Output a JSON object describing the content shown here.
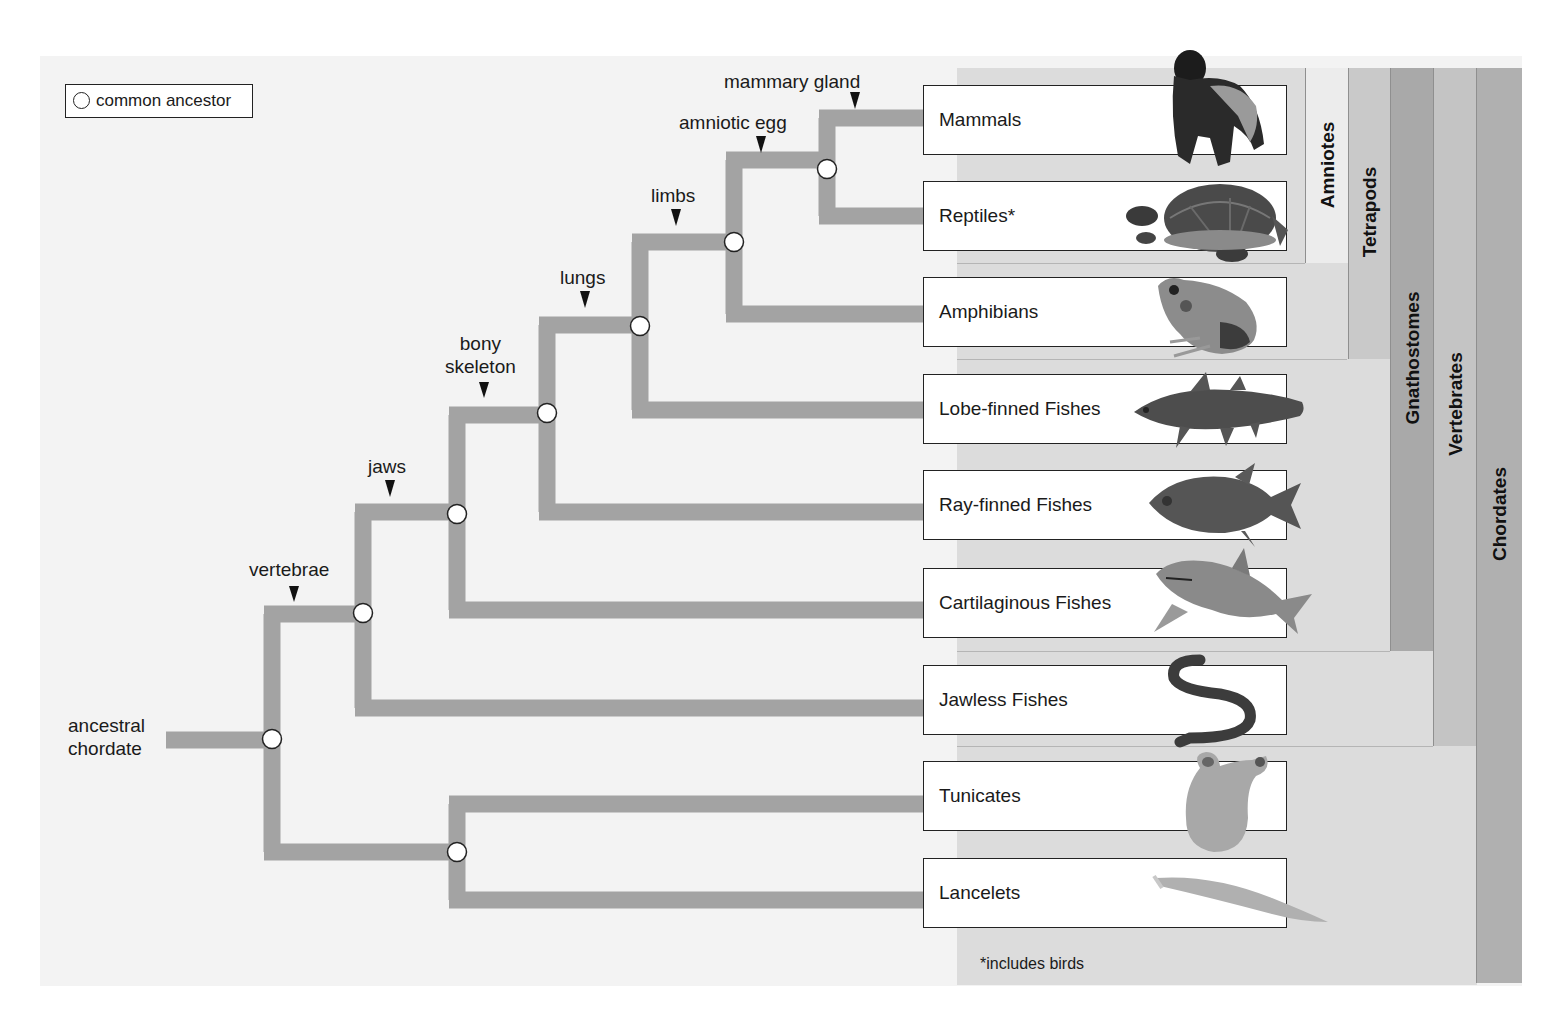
{
  "legend": {
    "icon": "open-circle-icon",
    "label": "common ancestor"
  },
  "root": {
    "line1": "ancestral",
    "line2": "chordate"
  },
  "traits": [
    {
      "id": "vertebrae",
      "label": "vertebrae"
    },
    {
      "id": "jaws",
      "label": "jaws"
    },
    {
      "id": "bony-skeleton",
      "line1": "bony",
      "line2": "skeleton"
    },
    {
      "id": "lungs",
      "label": "lungs"
    },
    {
      "id": "limbs",
      "label": "limbs"
    },
    {
      "id": "amniotic-egg",
      "label": "amniotic egg"
    },
    {
      "id": "mammary-gland",
      "label": "mammary gland"
    }
  ],
  "taxa": [
    {
      "label": "Mammals",
      "icon": "gorilla-icon"
    },
    {
      "label": "Reptiles*",
      "icon": "turtle-icon"
    },
    {
      "label": "Amphibians",
      "icon": "frog-icon"
    },
    {
      "label": "Lobe-finned Fishes",
      "icon": "coelacanth-icon"
    },
    {
      "label": "Ray-finned Fishes",
      "icon": "fish-icon"
    },
    {
      "label": "Cartilaginous Fishes",
      "icon": "shark-icon"
    },
    {
      "label": "Jawless Fishes",
      "icon": "lamprey-icon"
    },
    {
      "label": "Tunicates",
      "icon": "tunicate-icon"
    },
    {
      "label": "Lancelets",
      "icon": "lancelet-icon"
    }
  ],
  "groups": [
    {
      "label": "Amniotes",
      "color": "#ececec"
    },
    {
      "label": "Tetrapods",
      "color": "#c9c9c9"
    },
    {
      "label": "Gnathostomes",
      "color": "#a9a9a9"
    },
    {
      "label": "Vertebrates",
      "color": "#c4c4c4"
    },
    {
      "label": "Chordates",
      "color": "#b0b0b0"
    }
  ],
  "footnote": "*includes birds",
  "colors": {
    "branch": "#a3a3a3",
    "panel": "#f3f3f3",
    "node_fill": "#ffffff",
    "node_stroke": "#222222"
  }
}
